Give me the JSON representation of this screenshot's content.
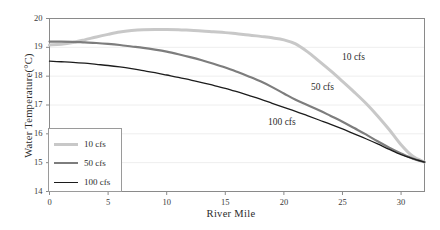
{
  "chart_data": {
    "type": "line",
    "title": "",
    "xlabel": "River Mile",
    "ylabel": "Water Temperature(°C)",
    "xlim": [
      0,
      32
    ],
    "ylim": [
      14,
      20
    ],
    "xticks": [
      0,
      5,
      10,
      15,
      20,
      25,
      30
    ],
    "xtick_labels": [
      "0",
      "5",
      "10",
      "15",
      "20",
      "25",
      "30"
    ],
    "yticks": [
      14,
      15,
      16,
      17,
      18,
      19,
      20
    ],
    "ytick_labels": [
      "14",
      "15",
      "16",
      "17",
      "18",
      "19",
      "20"
    ],
    "grid": "horizontal",
    "legend_position": "lower-left",
    "series": [
      {
        "name": "10 cfs",
        "color": "#c8c8c8",
        "width": 3.0,
        "annotation": "10 cfs",
        "x": [
          0,
          1,
          2,
          3,
          4,
          5,
          6,
          7,
          8,
          9,
          10,
          11,
          12,
          13,
          14,
          15,
          16,
          17,
          18,
          19,
          20,
          21,
          22,
          23,
          24,
          25,
          26,
          27,
          28,
          29,
          30,
          31,
          32
        ],
        "y": [
          19.08,
          19.11,
          19.17,
          19.26,
          19.36,
          19.45,
          19.53,
          19.58,
          19.61,
          19.62,
          19.62,
          19.61,
          19.59,
          19.57,
          19.54,
          19.51,
          19.47,
          19.43,
          19.38,
          19.33,
          19.26,
          19.12,
          18.85,
          18.52,
          18.18,
          17.82,
          17.45,
          17.06,
          16.62,
          16.14,
          15.62,
          15.22,
          15.02
        ]
      },
      {
        "name": "50 cfs",
        "color": "#7d7d7d",
        "width": 2.2,
        "annotation": "50 cfs",
        "x": [
          0,
          1,
          2,
          3,
          4,
          5,
          6,
          7,
          8,
          9,
          10,
          11,
          12,
          13,
          14,
          15,
          16,
          17,
          18,
          19,
          20,
          21,
          22,
          23,
          24,
          25,
          26,
          27,
          28,
          29,
          30,
          31,
          32
        ],
        "y": [
          19.2,
          19.2,
          19.19,
          19.17,
          19.15,
          19.12,
          19.08,
          19.03,
          18.98,
          18.92,
          18.85,
          18.76,
          18.66,
          18.55,
          18.43,
          18.3,
          18.15,
          17.99,
          17.82,
          17.62,
          17.4,
          17.18,
          17.0,
          16.82,
          16.62,
          16.42,
          16.2,
          15.98,
          15.74,
          15.52,
          15.32,
          15.14,
          15.02
        ]
      },
      {
        "name": "100 cfs",
        "color": "#1c1c1c",
        "width": 1.3,
        "annotation": "100 cfs",
        "x": [
          0,
          1,
          2,
          3,
          4,
          5,
          6,
          7,
          8,
          9,
          10,
          11,
          12,
          13,
          14,
          15,
          16,
          17,
          18,
          19,
          20,
          21,
          22,
          23,
          24,
          25,
          26,
          27,
          28,
          29,
          30,
          31,
          32
        ],
        "y": [
          18.52,
          18.5,
          18.48,
          18.45,
          18.41,
          18.37,
          18.32,
          18.26,
          18.19,
          18.12,
          18.04,
          17.96,
          17.87,
          17.78,
          17.68,
          17.58,
          17.46,
          17.33,
          17.2,
          17.06,
          16.92,
          16.78,
          16.63,
          16.48,
          16.33,
          16.17,
          16.0,
          15.83,
          15.65,
          15.46,
          15.28,
          15.14,
          15.02
        ]
      }
    ],
    "annotations": [
      {
        "text": "10 cfs",
        "x_px": 342,
        "y_px": 52
      },
      {
        "text": "50 cfs",
        "x_px": 311,
        "y_px": 82
      },
      {
        "text": "100 cfs",
        "x_px": 268,
        "y_px": 117
      }
    ]
  },
  "legend": {
    "items": [
      {
        "label": "10 cfs",
        "color": "#c8c8c8"
      },
      {
        "label": "50 cfs",
        "color": "#7d7d7d"
      },
      {
        "label": "100 cfs",
        "color": "#1c1c1c"
      }
    ]
  },
  "colors": {
    "frame": "#8a8a8a",
    "grid": "#eeeeee",
    "text": "#2b2b2b",
    "background": "#ffffff"
  }
}
